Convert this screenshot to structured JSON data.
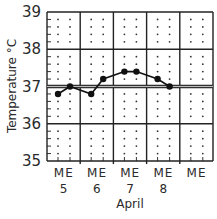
{
  "chart_data": {
    "type": "line",
    "title": "",
    "xlabel": "April",
    "ylabel": "Temperature °C",
    "ylim": [
      35,
      39
    ],
    "yticks": [
      35,
      36,
      37,
      38,
      39
    ],
    "grid": true,
    "reference_line": {
      "value": 37,
      "label": ""
    },
    "days": [
      "5",
      "6",
      "7",
      "8",
      ""
    ],
    "sub_ticks": [
      "M",
      "E"
    ],
    "categories": [
      "M 5",
      "E 5",
      "M 6",
      "E 6",
      "M 7",
      "E 7",
      "M 8",
      "E 8"
    ],
    "series": [
      {
        "name": "Temperature",
        "values": [
          36.8,
          37.0,
          36.8,
          37.2,
          37.4,
          37.4,
          37.2,
          37.0
        ]
      }
    ],
    "legend": null
  },
  "labels": {
    "y_title": "Temperature °C",
    "x_title": "April",
    "y_ticks": [
      "39",
      "38",
      "37",
      "36",
      "35"
    ],
    "m_label": "M",
    "e_label": "E",
    "day_labels": [
      "5",
      "6",
      "7",
      "8"
    ]
  }
}
